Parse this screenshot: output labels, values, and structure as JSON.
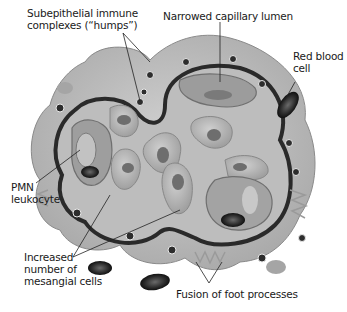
{
  "diagram": {
    "labels": [
      {
        "id": "humps",
        "line1": "Subepithelial immune",
        "line2": "complexes (“humps”)"
      },
      {
        "id": "lumen",
        "line1": "Narrowed capillary lumen"
      },
      {
        "id": "rbc",
        "line1": "Red blood",
        "line2": "cell"
      },
      {
        "id": "pmn",
        "line1": "PMN",
        "line2": "leukocyte"
      },
      {
        "id": "mesangial",
        "line1": "Increased",
        "line2": "number of",
        "line3": "mesangial cells"
      },
      {
        "id": "foot",
        "line1": "Fusion of foot processes"
      }
    ],
    "colors": {
      "tissue": "#c8c8c8",
      "tissue_dark": "#9a9a9a",
      "membrane": "#2a2a2a",
      "cell": "#b5b5b5",
      "nucleus": "#6e6e6e",
      "rbc": "#3a3a3a"
    }
  }
}
